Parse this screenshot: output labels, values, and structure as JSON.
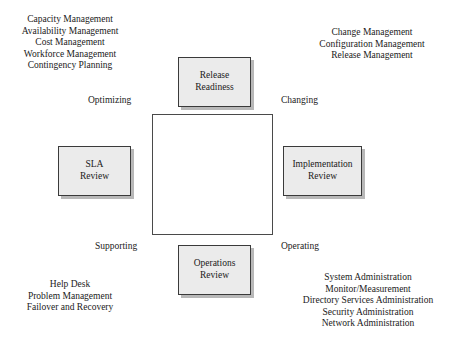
{
  "diagram": {
    "colors": {
      "box_fill": "#ebebeb",
      "box_border": "#3a3a3a",
      "box_shadow": "#b8b8b8",
      "center_border": "#4a4a4a",
      "background": "#ffffff",
      "text": "#1a1a1a"
    }
  },
  "quadrant_labels": {
    "optimizing": "Optimizing",
    "changing": "Changing",
    "supporting": "Supporting",
    "operating": "Operating"
  },
  "review_boxes": {
    "release": {
      "line1": "Release",
      "line2": "Readiness"
    },
    "sla": {
      "line1": "SLA",
      "line2": "Review"
    },
    "implementation": {
      "line1": "Implementation",
      "line2": "Review"
    },
    "operations": {
      "line1": "Operations",
      "line2": "Review"
    }
  },
  "corner_lists": {
    "top_left": {
      "items": [
        "Capacity Management",
        "Availability Management",
        "Cost Management",
        "Workforce Management",
        "Contingency Planning"
      ]
    },
    "top_right": {
      "items": [
        "Change Management",
        "Configuration Management",
        "Release Management"
      ]
    },
    "bottom_left": {
      "items": [
        "Help Desk",
        "Problem Management",
        "Failover and Recovery"
      ]
    },
    "bottom_right": {
      "items": [
        "System Administration",
        "Monitor/Measurement",
        "Directory Services Administration",
        "Security Administration",
        "Network Administration"
      ]
    }
  }
}
